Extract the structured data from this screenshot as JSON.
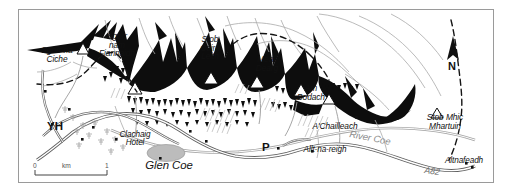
{
  "map": {
    "region_title": "Glen Coe",
    "orientation": {
      "north_label": "N",
      "icon": "north-arrow-icon"
    },
    "scale": {
      "min_label": "0",
      "unit_label": "km",
      "max_label": "1"
    },
    "border_color": "#9a9a9a",
    "background_color": "#ffffff",
    "ink_color": "#111111",
    "water_color": "#8d8d8d",
    "road_color": "#6f6f6f"
  },
  "peaks": [
    {
      "name": "Sgorr na\nCiche",
      "line1": "Sgorr na",
      "line2": "Ciche",
      "x": 35,
      "y": 43
    },
    {
      "name": "Sgorr nam Fiannaidh",
      "line1": "Sgorr",
      "line2": "nam",
      "line3": "Fiannaidh",
      "x": 93,
      "y": 30
    },
    {
      "name": "Stob Coire Leith",
      "line1": "Stob",
      "line2": "Coire",
      "line3": "Leith",
      "x": 190,
      "y": 32
    },
    {
      "name": "Meall Dearg",
      "line1": "Meall",
      "line2": "Dearg",
      "x": 248,
      "y": 53
    },
    {
      "name": "Am Bodach",
      "line1": "Am",
      "line2": "Bodach",
      "x": 293,
      "y": 81
    },
    {
      "name": "A'Chailleach",
      "line1": "A'Chailleach",
      "x": 316,
      "y": 119
    },
    {
      "name": "Stob Mhic Mhartuin",
      "line1": "Stob Mhic",
      "line2": "Mhartuin",
      "x": 426,
      "y": 110
    }
  ],
  "places": [
    {
      "name": "Clachaig Hotel",
      "line1": "Clachaig",
      "line2": "Hotel",
      "x": 116,
      "y": 129
    },
    {
      "name": "Allt-na-reigh",
      "line1": "Allt-na-reigh",
      "x": 306,
      "y": 142
    },
    {
      "name": "Altnafeadh",
      "line1": "Altnafeadh",
      "x": 450,
      "y": 153
    }
  ],
  "features": {
    "glen_label": "Glen Coe",
    "river_label": "River Coe",
    "road_label": "A82",
    "youth_hostel_symbol": "YH",
    "parking_symbol": "P"
  }
}
